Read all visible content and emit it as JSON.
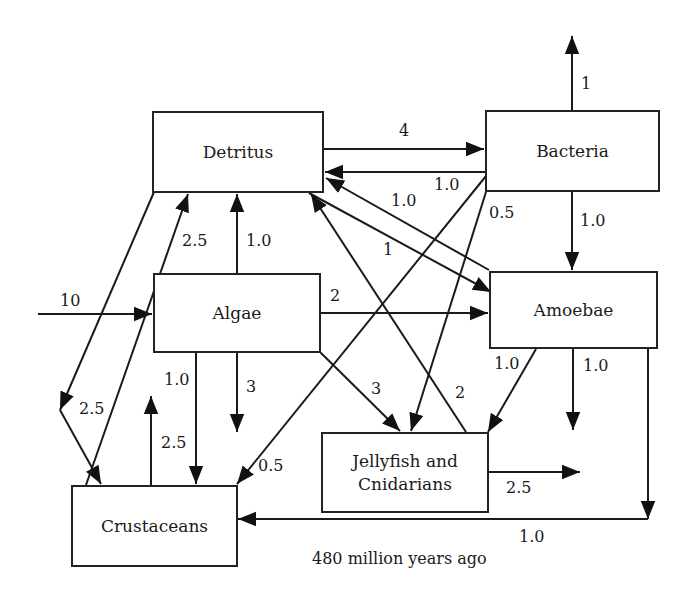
{
  "caption": "480 million years ago",
  "nodes": {
    "detritus": "Detritus",
    "bacteria": "Bacteria",
    "algae": "Algae",
    "amoebae": "Amoebae",
    "crustaceans": "Crustaceans",
    "jellyfish": "Jellyfish and Cnidarians"
  },
  "flows": [
    {
      "from": "Detritus",
      "to": "Bacteria",
      "value": "4"
    },
    {
      "from": "Bacteria",
      "to": "Detritus",
      "value": "1.0"
    },
    {
      "from": "Bacteria",
      "to": "out (up)",
      "value": "1"
    },
    {
      "from": "Bacteria",
      "to": "Amoebae",
      "value": "1.0"
    },
    {
      "from": "Bacteria",
      "to": "Jellyfish and Cnidarians",
      "value": "0.5"
    },
    {
      "from": "Bacteria",
      "to": "Crustaceans",
      "value": "0.5"
    },
    {
      "from": "Amoebae",
      "to": "Detritus",
      "value": "1.0"
    },
    {
      "from": "Detritus",
      "to": "Amoebae",
      "value": "1"
    },
    {
      "from": "Algae",
      "to": "Detritus",
      "value": "1.0"
    },
    {
      "from": "Crustaceans",
      "to": "Detritus",
      "value": "2.5"
    },
    {
      "from": "input",
      "to": "Algae",
      "value": "10"
    },
    {
      "from": "Algae",
      "to": "Amoebae",
      "value": "2"
    },
    {
      "from": "Algae",
      "to": "Jellyfish and Cnidarians",
      "value": "3"
    },
    {
      "from": "Algae",
      "to": "Crustaceans",
      "value": "1.0"
    },
    {
      "from": "Algae",
      "to": "out (down)",
      "value": "3"
    },
    {
      "from": "Detritus",
      "to": "Crustaceans",
      "value": "2.5"
    },
    {
      "from": "Crustaceans",
      "to": "out (up)",
      "value": "2.5"
    },
    {
      "from": "Jellyfish and Cnidarians",
      "to": "Detritus",
      "value": "2"
    },
    {
      "from": "Jellyfish and Cnidarians",
      "to": "out (right)",
      "value": "2.5"
    },
    {
      "from": "Amoebae",
      "to": "Jellyfish and Cnidarians",
      "value": "1.0"
    },
    {
      "from": "Amoebae",
      "to": "out (down)",
      "value": "1.0"
    },
    {
      "from": "Amoebae",
      "to": "Crustaceans",
      "value": "1.0"
    }
  ],
  "labels": {
    "det_bac": "4",
    "bac_det": "1.0",
    "bac_up": "1",
    "bac_amo": "1.0",
    "bac_jel": "0.5",
    "amo_det": "1.0",
    "det_amo": "1",
    "alg_det": "1.0",
    "cru_det": "2.5",
    "in_alg": "10",
    "alg_amo": "2",
    "alg_jel": "3",
    "alg_cru": "1.0",
    "alg_down": "3",
    "det_cru": "2.5",
    "cru_up": "2.5",
    "bac_cru": "0.5",
    "jel_det": "2",
    "jel_out": "2.5",
    "amo_jel": "1.0",
    "amo_down": "1.0",
    "amo_cru": "1.0"
  }
}
